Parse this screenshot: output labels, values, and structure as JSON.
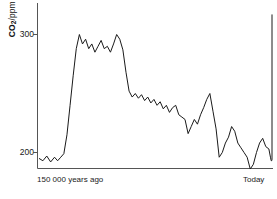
{
  "chart_data": {
    "type": "line",
    "title": "",
    "subtitle": "",
    "ylabel": "CO2/ppm",
    "ylabel_parts": {
      "bold": "CO",
      "subscript": "2",
      "unit": "/ppm"
    },
    "xlabel": "",
    "x_tick_labels": [
      "150 000 years ago",
      "Today"
    ],
    "y_tick_labels": [
      "300",
      "200"
    ],
    "y_ticks": [
      300,
      200
    ],
    "ylim": [
      180,
      320
    ],
    "xlim": [
      -150000,
      0
    ],
    "grid": false,
    "legend": false,
    "legend_position": "none",
    "line_color": "#1a1a1a",
    "axis_color": "#4d4d4d",
    "series": [
      {
        "name": "Atmospheric CO2 concentration",
        "units": "ppm",
        "x": [
          -150000,
          -147500,
          -145000,
          -142500,
          -140000,
          -138000,
          -136000,
          -134000,
          -132000,
          -130000,
          -128000,
          -126000,
          -124000,
          -122000,
          -120000,
          -118000,
          -116000,
          -114000,
          -112000,
          -110000,
          -108000,
          -106000,
          -104000,
          -102000,
          -100000,
          -98000,
          -96000,
          -94000,
          -92000,
          -90000,
          -88000,
          -86000,
          -84000,
          -82000,
          -80000,
          -78000,
          -76000,
          -74000,
          -72000,
          -70000,
          -68000,
          -66000,
          -64000,
          -62000,
          -60000,
          -58000,
          -56000,
          -54000,
          -52000,
          -50000,
          -48000,
          -46000,
          -44000,
          -42000,
          -40000,
          -38000,
          -36000,
          -34000,
          -32000,
          -30000,
          -28000,
          -26000,
          -24000,
          -22000,
          -20000,
          -18000,
          -16000,
          -14000,
          -12000,
          -10000,
          -8000,
          -6000,
          -4000,
          -2000,
          -1000,
          -500,
          -200,
          0
        ],
        "values": [
          195,
          193,
          197,
          192,
          196,
          193,
          196,
          199,
          215,
          240,
          265,
          288,
          300,
          292,
          296,
          288,
          292,
          285,
          290,
          295,
          288,
          290,
          285,
          292,
          300,
          296,
          287,
          268,
          252,
          247,
          250,
          246,
          249,
          244,
          247,
          242,
          245,
          240,
          243,
          237,
          240,
          234,
          238,
          240,
          232,
          230,
          228,
          216,
          222,
          228,
          224,
          232,
          238,
          245,
          250,
          235,
          220,
          196,
          200,
          208,
          213,
          222,
          218,
          208,
          204,
          200,
          196,
          186,
          190,
          200,
          208,
          212,
          205,
          203,
          196,
          193,
          193,
          194
        ]
      }
    ],
    "annotations": [
      {
        "text": "sharp modern rise",
        "x": -1000,
        "y": 315,
        "visible": false
      }
    ],
    "series_final_value": 317,
    "series_peak_value": 300,
    "series_min_value": 186
  },
  "axes": {
    "y_axis_visible": true,
    "x_axis_visible": true,
    "top_spine_visible": false,
    "right_spine_visible": false
  }
}
